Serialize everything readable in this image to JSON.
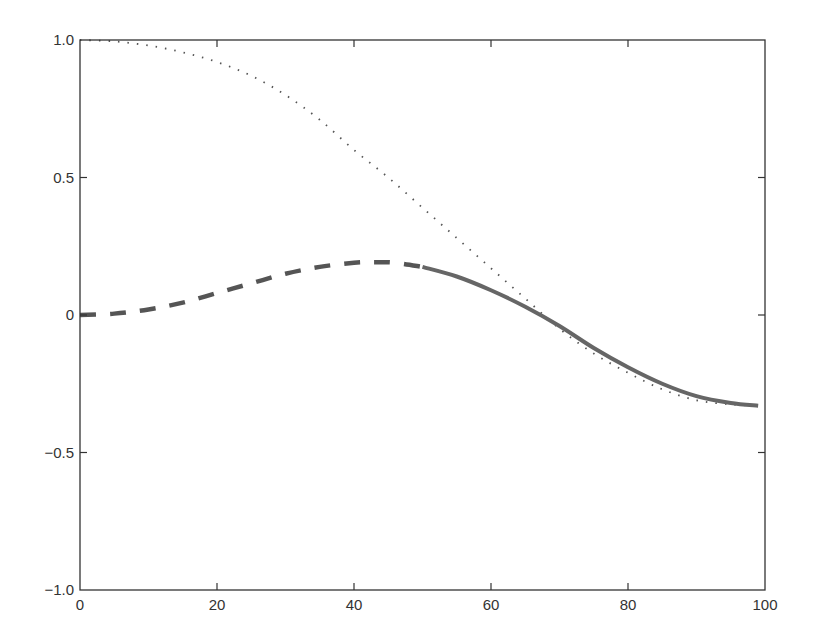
{
  "chart_data": {
    "type": "line",
    "title": "",
    "xlabel": "",
    "ylabel": "",
    "xlim": [
      0,
      100
    ],
    "ylim": [
      -1.0,
      1.0
    ],
    "grid": false,
    "legend": null,
    "x_ticks": [
      0,
      20,
      40,
      60,
      80,
      100
    ],
    "x_tick_labels": [
      "0",
      "20",
      "40",
      "60",
      "80",
      "100"
    ],
    "y_ticks": [
      -1.0,
      -0.5,
      0,
      0.5,
      1.0
    ],
    "y_tick_labels": [
      "−1.0",
      "−0.5",
      "0",
      "0.5",
      "1.0"
    ],
    "series": [
      {
        "name": "dotted",
        "style": "dotted",
        "color": "#555555",
        "x": [
          0,
          5,
          10,
          15,
          20,
          25,
          30,
          35,
          40,
          45,
          50,
          55,
          60,
          65,
          70,
          75,
          80,
          85,
          90,
          95,
          99
        ],
        "y": [
          1.0,
          0.995,
          0.98,
          0.955,
          0.92,
          0.87,
          0.8,
          0.71,
          0.6,
          0.5,
          0.39,
          0.28,
          0.17,
          0.06,
          -0.05,
          -0.14,
          -0.21,
          -0.27,
          -0.31,
          -0.325,
          -0.33
        ]
      },
      {
        "name": "dashed",
        "style": "dashed",
        "color": "#555555",
        "x": [
          0,
          5,
          10,
          15,
          20,
          25,
          30,
          35,
          40,
          43,
          46,
          50
        ],
        "y": [
          0.0,
          0.005,
          0.02,
          0.045,
          0.08,
          0.115,
          0.15,
          0.175,
          0.19,
          0.192,
          0.19,
          0.175
        ]
      },
      {
        "name": "solid",
        "style": "solid",
        "color": "#666666",
        "x": [
          50,
          55,
          60,
          65,
          70,
          75,
          80,
          85,
          90,
          95,
          99
        ],
        "y": [
          0.175,
          0.14,
          0.09,
          0.03,
          -0.04,
          -0.12,
          -0.19,
          -0.25,
          -0.295,
          -0.32,
          -0.33
        ]
      }
    ]
  }
}
